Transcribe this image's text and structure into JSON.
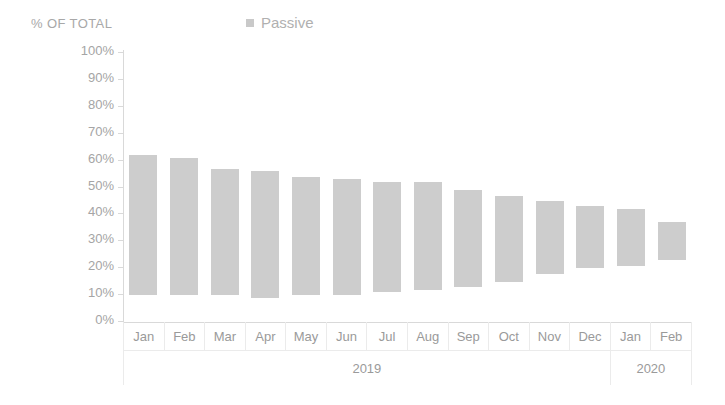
{
  "header": {
    "axis_title": "% OF TOTAL",
    "legend": [
      {
        "label": "Passive",
        "color": "#c9c9c9",
        "marker": "square-swatch"
      }
    ]
  },
  "chart_data": {
    "type": "bar",
    "subtype": "floating-range-bar",
    "title": "",
    "subtitle": "",
    "xlabel": "",
    "ylabel": "% OF TOTAL",
    "ylim": [
      0,
      100
    ],
    "ytick_labels": [
      "100%",
      "90%",
      "80%",
      "70%",
      "60%",
      "50%",
      "40%",
      "30%",
      "20%",
      "10%",
      "0%"
    ],
    "ytick_values": [
      100,
      90,
      80,
      70,
      60,
      50,
      40,
      30,
      20,
      10,
      0
    ],
    "grid": false,
    "legend_position": "top-center",
    "bar_color": "#cdcdcd",
    "categories": [
      "Jan",
      "Feb",
      "Mar",
      "Apr",
      "May",
      "Jun",
      "Jul",
      "Aug",
      "Sep",
      "Oct",
      "Nov",
      "Dec",
      "Jan",
      "Feb"
    ],
    "category_groups": [
      {
        "label": "2019",
        "span": 12
      },
      {
        "label": "2020",
        "span": 2
      }
    ],
    "series": [
      {
        "name": "Passive",
        "color": "#cdcdcd",
        "low": [
          10,
          10,
          10,
          9,
          10,
          10,
          11,
          12,
          13,
          15,
          18,
          20,
          21,
          23
        ],
        "high": [
          62,
          61,
          57,
          56,
          54,
          53,
          52,
          52,
          49,
          47,
          45,
          43,
          42,
          37
        ]
      }
    ]
  }
}
